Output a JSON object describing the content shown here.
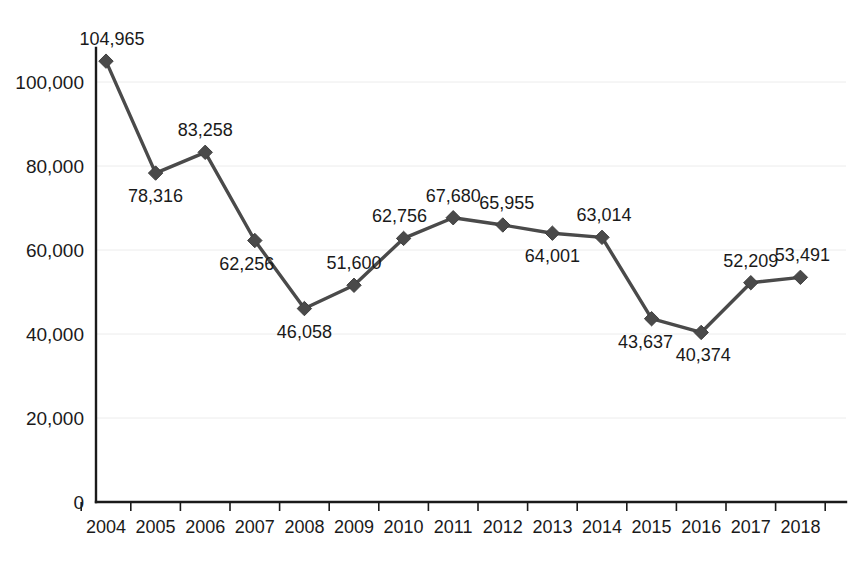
{
  "chart_data": {
    "type": "line",
    "title": "",
    "subtitle": "",
    "xlabel": "",
    "ylabel": "",
    "categories": [
      "2004",
      "2005",
      "2006",
      "2007",
      "2008",
      "2009",
      "2010",
      "2011",
      "2012",
      "2013",
      "2014",
      "2015",
      "2016",
      "2017",
      "2018"
    ],
    "values": [
      104965,
      78316,
      83258,
      62256,
      46058,
      51600,
      62756,
      67680,
      65955,
      64001,
      63014,
      43637,
      40374,
      52209,
      53491
    ],
    "point_labels": [
      "104,965",
      "78,316",
      "83,258",
      "62,256",
      "46,058",
      "51,600",
      "62,756",
      "67,680",
      "65,955",
      "64,001",
      "63,014",
      "43,637",
      "40,374",
      "52,209",
      "53,491"
    ],
    "label_positions": [
      "above",
      "below",
      "above",
      "below",
      "below",
      "above",
      "above",
      "above",
      "above",
      "below",
      "above",
      "below",
      "below",
      "above",
      "above"
    ],
    "ylim": [
      0,
      112000
    ],
    "yticks": [
      0,
      20000,
      40000,
      60000,
      80000,
      100000
    ],
    "ytick_labels": [
      "0",
      "20,000",
      "40,000",
      "60,000",
      "80,000",
      "100,000"
    ],
    "grid": true,
    "legend": "none",
    "series_color": "#4a4a4a",
    "gridline_color": "#ececec",
    "axis_color": "#1a1a1a",
    "background_color": "#ffffff",
    "marker": "diamond"
  }
}
